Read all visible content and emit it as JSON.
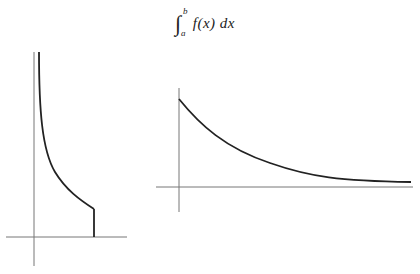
{
  "formula": {
    "integral_sign": "∫",
    "upper_limit": "b",
    "lower_limit": "a",
    "integrand": "f(x) dx"
  },
  "diagrams": [
    {
      "name": "left-graph",
      "description": "Curve with vertical asymptote at x=0 on the left, truncated at x=b with a vertical drop to the x-axis",
      "axis_color": "#777777",
      "curve_color": "#222222"
    },
    {
      "name": "right-graph",
      "description": "Exponentially decaying curve starting at finite value on y-axis and approaching x-axis asymptotically",
      "axis_color": "#777777",
      "curve_color": "#222222"
    }
  ]
}
